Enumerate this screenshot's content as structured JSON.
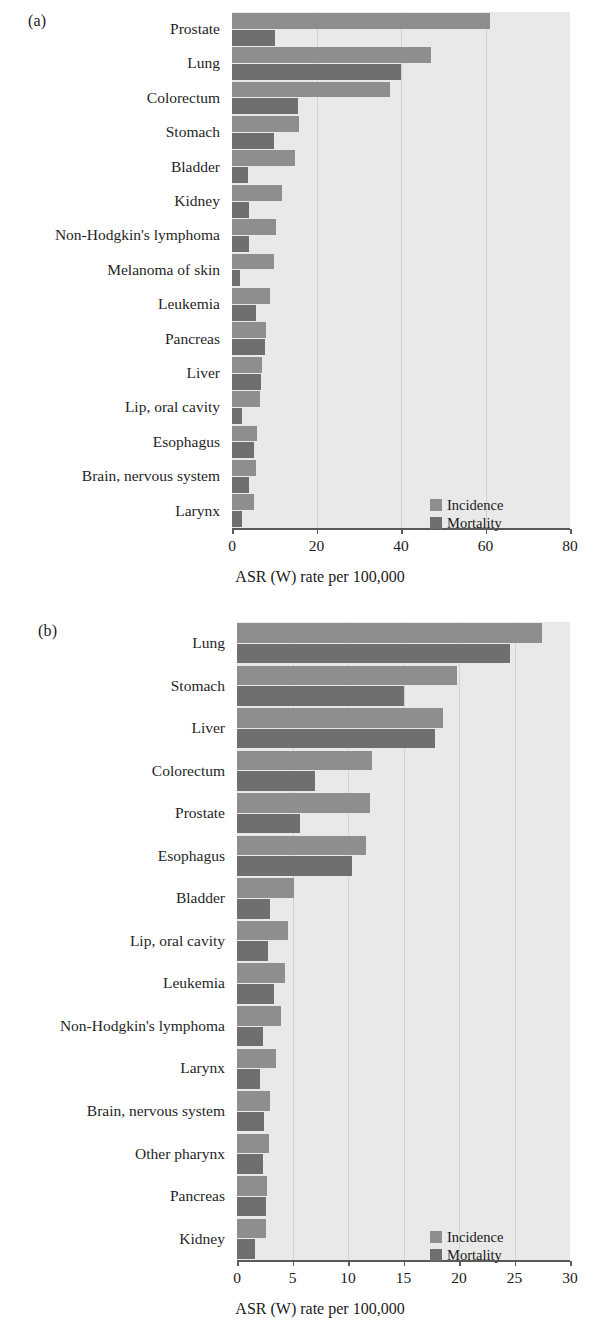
{
  "figure": {
    "panels": [
      {
        "tag": "(a)",
        "axis_title": "ASR (W) rate per 100,000",
        "legend": [
          {
            "label": "Incidence",
            "color": "#8e8e8e"
          },
          {
            "label": "Mortality",
            "color": "#6f6f6f"
          }
        ],
        "ticks": [
          "0",
          "20",
          "40",
          "60",
          "80"
        ]
      },
      {
        "tag": "(b)",
        "axis_title": "ASR (W) rate per 100,000",
        "legend": [
          {
            "label": "Incidence",
            "color": "#8e8e8e"
          },
          {
            "label": "Mortality",
            "color": "#6f6f6f"
          }
        ],
        "ticks": [
          "0",
          "5",
          "10",
          "15",
          "20",
          "25",
          "30"
        ]
      }
    ]
  },
  "chart_data": [
    {
      "type": "bar",
      "orientation": "horizontal",
      "panel": "(a)",
      "title": "",
      "xlabel": "ASR (W) rate per 100,000",
      "ylabel": "",
      "xlim": [
        0,
        80
      ],
      "xticks": [
        0,
        20,
        40,
        60,
        80
      ],
      "grid": true,
      "legend_position": "bottom-right",
      "categories": [
        "Prostate",
        "Lung",
        "Colorectum",
        "Stomach",
        "Bladder",
        "Kidney",
        "Non-Hodgkin's lymphoma",
        "Melanoma of skin",
        "Leukemia",
        "Pancreas",
        "Liver",
        "Lip, oral cavity",
        "Esophagus",
        "Brain, nervous system",
        "Larynx"
      ],
      "series": [
        {
          "name": "Incidence",
          "color": "#8e8e8e",
          "values": [
            61.0,
            47.0,
            37.5,
            15.8,
            15.0,
            11.8,
            10.5,
            10.0,
            9.0,
            8.0,
            7.2,
            6.6,
            6.0,
            5.6,
            5.2
          ]
        },
        {
          "name": "Mortality",
          "color": "#6f6f6f",
          "values": [
            10.2,
            40.0,
            15.6,
            10.0,
            3.8,
            4.0,
            4.0,
            2.0,
            5.6,
            7.8,
            6.8,
            2.4,
            5.2,
            4.0,
            2.4
          ]
        }
      ]
    },
    {
      "type": "bar",
      "orientation": "horizontal",
      "panel": "(b)",
      "title": "",
      "xlabel": "ASR (W) rate per 100,000",
      "ylabel": "",
      "xlim": [
        0,
        30
      ],
      "xticks": [
        0,
        5,
        10,
        15,
        20,
        25,
        30
      ],
      "grid": true,
      "legend_position": "bottom-right",
      "categories": [
        "Lung",
        "Stomach",
        "Liver",
        "Colorectum",
        "Prostate",
        "Esophagus",
        "Bladder",
        "Lip, oral cavity",
        "Leukemia",
        "Non-Hodgkin's lymphoma",
        "Larynx",
        "Brain, nervous system",
        "Other pharynx",
        "Pancreas",
        "Kidney"
      ],
      "series": [
        {
          "name": "Incidence",
          "color": "#8e8e8e",
          "values": [
            27.5,
            19.8,
            18.6,
            12.2,
            12.0,
            11.6,
            5.1,
            4.6,
            4.3,
            4.0,
            3.5,
            3.0,
            2.9,
            2.7,
            2.6
          ]
        },
        {
          "name": "Mortality",
          "color": "#6f6f6f",
          "values": [
            24.6,
            15.0,
            17.8,
            7.0,
            5.7,
            10.4,
            3.0,
            2.8,
            3.3,
            2.3,
            2.1,
            2.4,
            2.3,
            2.6,
            1.6
          ]
        }
      ]
    }
  ]
}
